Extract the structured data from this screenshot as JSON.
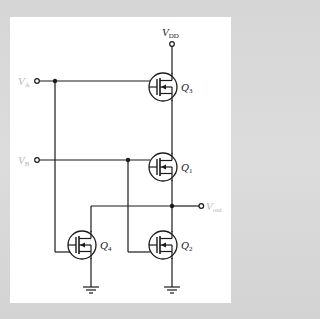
{
  "diagram": {
    "type": "circuit-schematic",
    "supply": {
      "label": "V",
      "sub": "DD"
    },
    "inputs": [
      {
        "label": "V",
        "sub": "A"
      },
      {
        "label": "V",
        "sub": "B"
      }
    ],
    "output": {
      "label": "V",
      "sub": "out"
    },
    "transistors": [
      {
        "id": "Q3",
        "label": "Q",
        "sub": "3"
      },
      {
        "id": "Q1",
        "label": "Q",
        "sub": "1"
      },
      {
        "id": "Q4",
        "label": "Q",
        "sub": "4"
      },
      {
        "id": "Q2",
        "label": "Q",
        "sub": "2"
      }
    ],
    "colors": {
      "wire": "#1a1a1a",
      "panel": "#ffffff",
      "background": "#d8d8d8",
      "input_label": "#b8b8b8"
    }
  }
}
